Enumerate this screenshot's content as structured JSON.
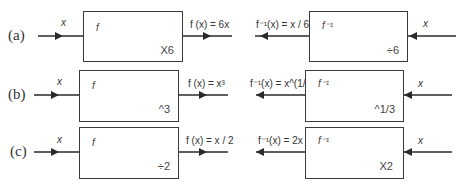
{
  "rows": [
    {
      "label": "(a)",
      "forward": {
        "input": "x",
        "name": "f",
        "op": "X6",
        "output": "f (x) = 6x"
      },
      "inverse": {
        "input": "x",
        "name": "f⁻¹",
        "op": "÷6",
        "output": "f⁻¹(x) = x / 6"
      }
    },
    {
      "label": "(b)",
      "forward": {
        "input": "x",
        "name": "f",
        "op": "^3",
        "output": "f (x) = x³"
      },
      "inverse": {
        "input": "x",
        "name": "f⁻¹",
        "op": "^1/3",
        "output": "f⁻¹(x) = x^(1/3)"
      }
    },
    {
      "label": "(c)",
      "forward": {
        "input": "x",
        "name": "f",
        "op": "÷2",
        "output": "f (x) = x / 2"
      },
      "inverse": {
        "input": "x",
        "name": "f⁻¹",
        "op": "X2",
        "output": "f⁻¹(x) = 2x"
      }
    }
  ],
  "colors": {
    "line": "#2a2a2a",
    "box_border": "#3a3a3a",
    "background": "#ffffff"
  }
}
